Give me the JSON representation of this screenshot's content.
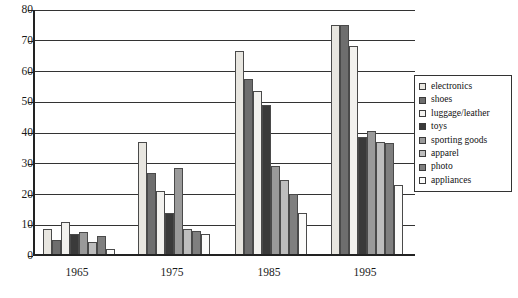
{
  "chart_data": {
    "type": "bar",
    "title": "",
    "subtitle": "",
    "xlabel": "",
    "ylabel": "",
    "categories": [
      "1965",
      "1975",
      "1985",
      "1995"
    ],
    "ylim": [
      0,
      80
    ],
    "yticks": [
      0,
      10,
      20,
      30,
      40,
      50,
      60,
      70,
      80
    ],
    "ytick_labels": [
      "0",
      "10",
      "20",
      "30",
      "40",
      "50",
      "60",
      "70",
      "80"
    ],
    "grid": "horizontal",
    "legend_position": "right",
    "series": [
      {
        "name": "electronics",
        "color": "#e8e6e0",
        "values": [
          8.0,
          36.5,
          66.0,
          74.5
        ]
      },
      {
        "name": "shoes",
        "color": "#6e6e6e",
        "values": [
          4.5,
          26.5,
          57.0,
          74.5
        ]
      },
      {
        "name": "luggage/leather",
        "color": "#f2f1ee",
        "values": [
          10.5,
          20.5,
          53.0,
          67.5
        ]
      },
      {
        "name": "toys",
        "color": "#3a3a3a",
        "values": [
          6.5,
          13.5,
          48.5,
          38.0
        ]
      },
      {
        "name": "sporting goods",
        "color": "#9a9a9a",
        "values": [
          7.0,
          28.0,
          28.5,
          40.0
        ]
      },
      {
        "name": "apparel",
        "color": "#bdbdbd",
        "values": [
          4.0,
          8.0,
          24.0,
          36.5
        ]
      },
      {
        "name": "photo",
        "color": "#7f7f7f",
        "values": [
          6.0,
          7.5,
          19.5,
          36.0
        ]
      },
      {
        "name": "appliances",
        "color": "#fbfbfa",
        "values": [
          1.5,
          6.5,
          13.5,
          22.5
        ]
      }
    ]
  },
  "legend": {
    "items": [
      {
        "label": "electronics"
      },
      {
        "label": "shoes"
      },
      {
        "label": "luggage/leather"
      },
      {
        "label": "toys"
      },
      {
        "label": "sporting goods"
      },
      {
        "label": "apparel"
      },
      {
        "label": "photo"
      },
      {
        "label": "appliances"
      }
    ]
  }
}
